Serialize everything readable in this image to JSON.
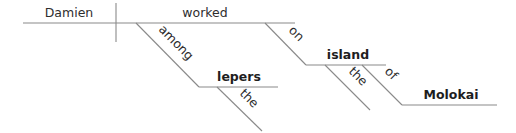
{
  "diagram": {
    "type": "Reed-Kellogg sentence diagram",
    "sentence_words": {
      "subject": "Damien",
      "verb": "worked",
      "prep1": "among",
      "prep1_object": "lepers",
      "prep1_object_modifier": "the",
      "prep2": "on",
      "prep2_object": "island",
      "prep2_object_modifier": "the",
      "prep3": "of",
      "prep3_object": "Molokai"
    },
    "colors": {
      "line": "#8a8a8a",
      "text": "#2e2e2e",
      "bold_text": "#1e1e1e",
      "background": "#ffffff"
    }
  }
}
